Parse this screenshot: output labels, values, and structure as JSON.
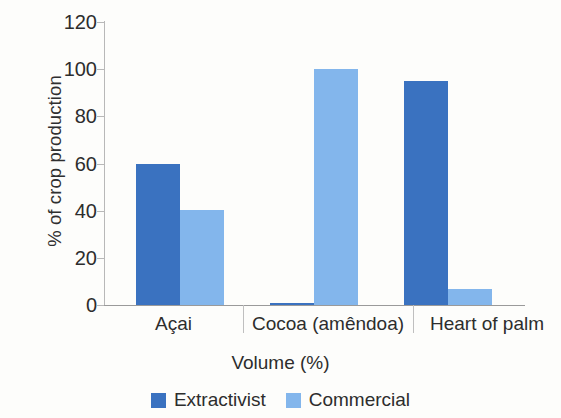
{
  "chart_data": {
    "type": "bar",
    "title": "",
    "xlabel": "Volume (%)",
    "ylabel": "% of crop production",
    "categories": [
      "Açai",
      "Cocoa (amêndoa)",
      "Heart of palm"
    ],
    "series": [
      {
        "name": "Extractivist",
        "color": "#3a72c0",
        "values": [
          60,
          0.5,
          95
        ]
      },
      {
        "name": "Commercial",
        "color": "#83b6ec",
        "values": [
          40.5,
          100,
          7
        ]
      }
    ],
    "ylim": [
      0,
      120
    ],
    "yticks": [
      0,
      20,
      40,
      60,
      80,
      100,
      120
    ],
    "ytick_labels": [
      "0",
      "20",
      "40",
      "60",
      "80",
      "100",
      "120"
    ],
    "grid": false,
    "legend_position": "bottom"
  },
  "axes": {
    "y_title": "% of crop production",
    "x_title": "Volume (%)",
    "y_labels": {
      "t0": "0",
      "t20": "20",
      "t40": "40",
      "t60": "60",
      "t80": "80",
      "t100": "100",
      "t120": "120"
    },
    "x_labels": {
      "c0": "Açai",
      "c1": "Cocoa (amêndoa)",
      "c2": "Heart of palm"
    }
  },
  "legend": {
    "items": [
      {
        "label": "Extractivist",
        "color": "#3a72c0"
      },
      {
        "label": "Commercial",
        "color": "#83b6ec"
      }
    ]
  }
}
